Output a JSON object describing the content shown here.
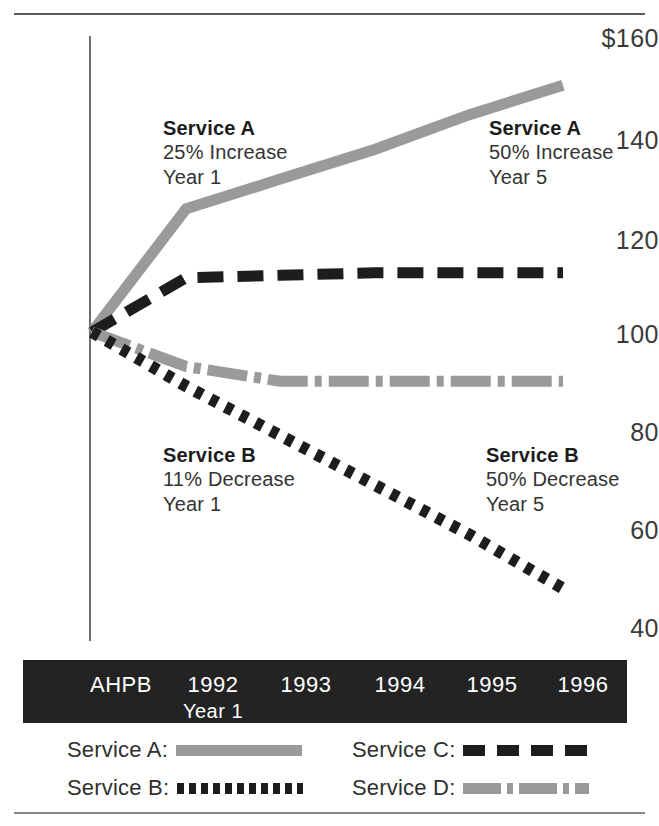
{
  "chart_data": {
    "type": "line",
    "title": "",
    "xlabel": "",
    "ylabel": "",
    "ylim": [
      40,
      160
    ],
    "xlim": [
      0,
      5
    ],
    "grid": false,
    "legend_position": "bottom",
    "y_ticks": [
      "$160",
      "140",
      "120",
      "100",
      "80",
      "60",
      "40"
    ],
    "y_tick_values": [
      160,
      140,
      120,
      100,
      80,
      60,
      40
    ],
    "categories": [
      "AHPB",
      "1992",
      "1993",
      "1994",
      "1995",
      "1996"
    ],
    "category_sublabels": [
      "",
      "Year 1",
      "",
      "",
      "",
      ""
    ],
    "series": [
      {
        "name": "Service A",
        "style": "solid",
        "color": "#9a9a9a",
        "values": [
          100,
          125,
          131,
          137,
          144,
          150
        ]
      },
      {
        "name": "Service B",
        "style": "dotted",
        "color": "#1d1d1d",
        "values": [
          100,
          89,
          79,
          69,
          59,
          48
        ]
      },
      {
        "name": "Service C",
        "style": "dashed",
        "color": "#1d1d1d",
        "values": [
          100,
          111,
          111.5,
          112,
          112,
          112
        ]
      },
      {
        "name": "Service D",
        "style": "dash-dot",
        "color": "#9a9a9a",
        "values": [
          100,
          93,
          90,
          90,
          90,
          90
        ]
      }
    ],
    "annotations": [
      {
        "id": "service-a-year1",
        "title": "Service A",
        "line2": "25% Increase",
        "line3": "Year 1"
      },
      {
        "id": "service-a-year5",
        "title": "Service A",
        "line2": "50% Increase",
        "line3": "Year 5"
      },
      {
        "id": "service-b-year1",
        "title": "Service B",
        "line2": "11% Decrease",
        "line3": "Year 1"
      },
      {
        "id": "service-b-year5",
        "title": "Service B",
        "line2": "50% Decrease",
        "line3": "Year 5"
      }
    ]
  },
  "legend": {
    "items": [
      {
        "label": "Service A:",
        "style": "solid",
        "color": "#9a9a9a"
      },
      {
        "label": "Service B:",
        "style": "dotted",
        "color": "#1d1d1d"
      },
      {
        "label": "Service C:",
        "style": "dashed",
        "color": "#1d1d1d"
      },
      {
        "label": "Service D:",
        "style": "dash-dot",
        "color": "#9a9a9a"
      }
    ]
  },
  "axis": {
    "y": {
      "t160": "$160",
      "t140": "140",
      "t120": "120",
      "t100": "100",
      "t80": "80",
      "t60": "60",
      "t40": "40"
    },
    "x": {
      "c0": "AHPB",
      "c1": "1992",
      "c1_sub": "Year 1",
      "c2": "1993",
      "c3": "1994",
      "c4": "1995",
      "c5": "1996"
    }
  },
  "annotations": {
    "a1": {
      "title": "Service A",
      "line2": "25% Increase",
      "line3": "Year 1"
    },
    "a2": {
      "title": "Service A",
      "line2": "50% Increase",
      "line3": "Year 5"
    },
    "b1": {
      "title": "Service B",
      "line2": "11% Decrease",
      "line3": "Year 1"
    },
    "b2": {
      "title": "Service B",
      "line2": "50% Decrease",
      "line3": "Year 5"
    }
  }
}
